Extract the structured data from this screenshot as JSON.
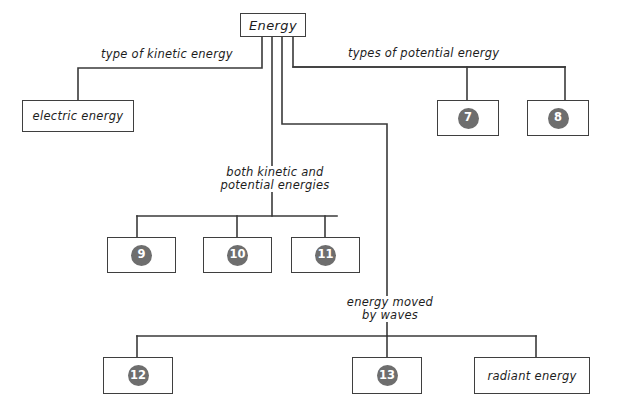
{
  "diagram": {
    "colors": {
      "line": "#3a3a3a",
      "box_border": "#3f3f3f",
      "badge_fill": "#6e6e6e",
      "badge_text": "#ffffff",
      "background": "#ffffff",
      "text": "#1d1d1d"
    },
    "root": {
      "label": "Energy"
    },
    "branch_labels": {
      "kinetic": "type of kinetic energy",
      "potential": "types of potential energy",
      "both": "both kinetic and\npotential energies",
      "waves": "energy moved\nby waves"
    },
    "nodes": {
      "electric_energy": {
        "label": "electric energy",
        "type": "text"
      },
      "n7": {
        "label": "7",
        "type": "badge"
      },
      "n8": {
        "label": "8",
        "type": "badge"
      },
      "n9": {
        "label": "9",
        "type": "badge"
      },
      "n10": {
        "label": "10",
        "type": "badge"
      },
      "n11": {
        "label": "11",
        "type": "badge"
      },
      "n12": {
        "label": "12",
        "type": "badge"
      },
      "n13": {
        "label": "13",
        "type": "badge"
      },
      "radiant_energy": {
        "label": "radiant energy",
        "type": "text"
      }
    }
  }
}
